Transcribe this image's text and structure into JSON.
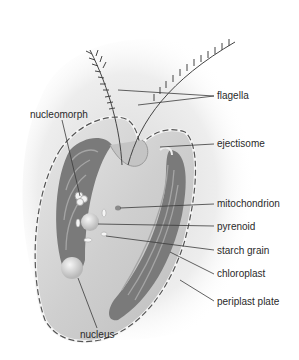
{
  "diagram": {
    "colors": {
      "background": "#ffffff",
      "cell_fill": "#d8d8d8",
      "chloroplast": "#6e6e6e",
      "leader_line": "#3a3a3a",
      "label_text": "#2a2a2a"
    },
    "labels": {
      "flagella": "flagella",
      "ejectisome": "ejectisome",
      "mitochondrion": "mitochondrion",
      "pyrenoid": "pyrenoid",
      "starch_grain": "starch grain",
      "chloroplast": "chloroplast",
      "periplast_plate": "periplast plate",
      "nucleomorph": "nucleomorph",
      "nucleus": "nucleus"
    }
  }
}
